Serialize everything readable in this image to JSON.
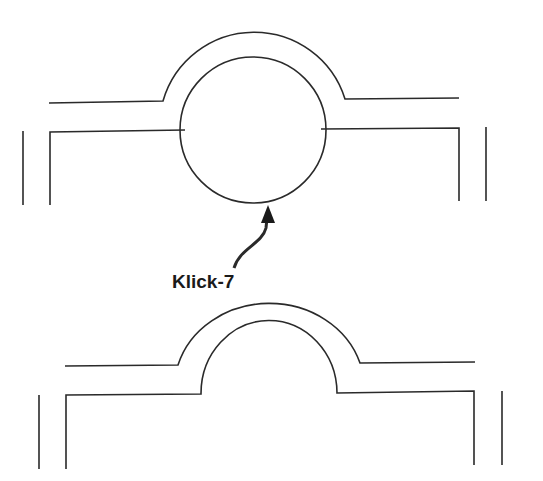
{
  "diagram": {
    "label": "Klick-7",
    "colors": {
      "stroke": "#2a2a2a",
      "label": "#1a1a1a",
      "background": "#ffffff"
    },
    "top_figure": {
      "description": "profile with circular element inserted into groove"
    },
    "bottom_figure": {
      "description": "profile with empty semicircular groove"
    },
    "arrow": {
      "points_to": "bottom of circular element"
    }
  }
}
